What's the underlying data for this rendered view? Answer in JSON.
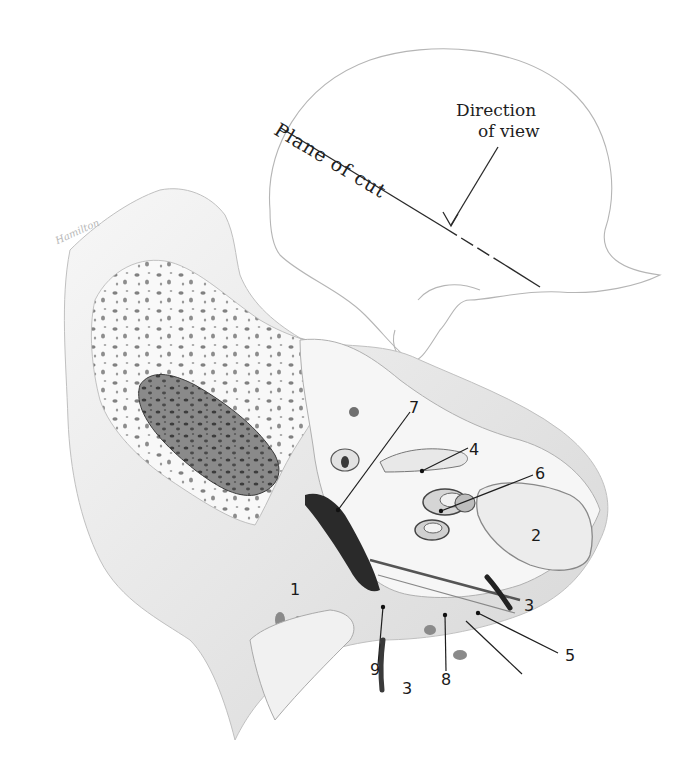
{
  "figure": {
    "type": "anatomical-illustration",
    "inset": {
      "plane_label": "Plane of cut",
      "direction_label_line1": "Direction",
      "direction_label_line2": "of view"
    },
    "signature": "Hamilton",
    "labels": [
      {
        "id": "1",
        "text": "1"
      },
      {
        "id": "2",
        "text": "2"
      },
      {
        "id": "3a",
        "text": "3"
      },
      {
        "id": "3b",
        "text": "3"
      },
      {
        "id": "4",
        "text": "4"
      },
      {
        "id": "5",
        "text": "5"
      },
      {
        "id": "6",
        "text": "6"
      },
      {
        "id": "7",
        "text": "7"
      },
      {
        "id": "8",
        "text": "8"
      },
      {
        "id": "9",
        "text": "9"
      }
    ],
    "colors": {
      "ink": "#1a1a1a",
      "pencil_light": "#c8c8c8",
      "pencil_mid": "#9a9a9a",
      "pencil_dark": "#4a4a4a",
      "paper": "#ffffff"
    }
  }
}
